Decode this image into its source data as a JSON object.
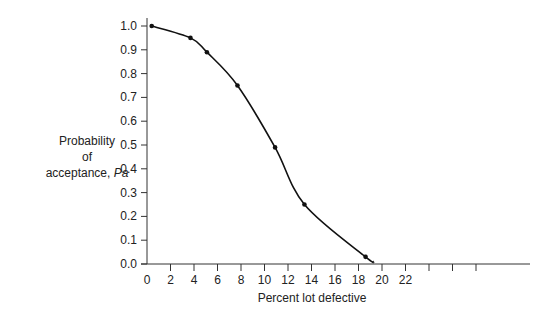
{
  "chart_data": {
    "type": "line",
    "title": "",
    "xlabel": "Percent lot defective",
    "ylabel": {
      "line1": "Probability",
      "line2": "of",
      "line3_prefix": "acceptance, ",
      "line3_italic": "Pa"
    },
    "xlim": [
      0,
      32
    ],
    "ylim": [
      0.0,
      1.0
    ],
    "x_ticks": [
      0,
      2,
      4,
      6,
      8,
      10,
      12,
      14,
      16,
      18,
      20,
      22,
      24,
      26,
      28
    ],
    "x_tick_labels": [
      "0",
      "2",
      "4",
      "6",
      "8",
      "10",
      "12",
      "14",
      "16",
      "18",
      "20",
      "22",
      "",
      "",
      ""
    ],
    "y_ticks": [
      0.0,
      0.1,
      0.2,
      0.3,
      0.4,
      0.5,
      0.6,
      0.7,
      0.8,
      0.9,
      1.0
    ],
    "y_tick_labels": [
      "0.0",
      "0.1",
      "0.2",
      "0.3",
      "0.4",
      "0.5",
      "0.6",
      "0.7",
      "0.8",
      "0.9",
      "1.0"
    ],
    "grid": false,
    "legend": null,
    "series": [
      {
        "name": "OC curve",
        "points": [
          {
            "x": 0.4,
            "y": 1.0
          },
          {
            "x": 3.7,
            "y": 0.95
          },
          {
            "x": 5.1,
            "y": 0.89
          },
          {
            "x": 7.7,
            "y": 0.75
          },
          {
            "x": 10.9,
            "y": 0.49
          },
          {
            "x": 13.4,
            "y": 0.25
          },
          {
            "x": 18.6,
            "y": 0.03
          }
        ],
        "curve_end": {
          "x": 19.3,
          "y": 0.01
        },
        "color": "#111111"
      }
    ]
  }
}
